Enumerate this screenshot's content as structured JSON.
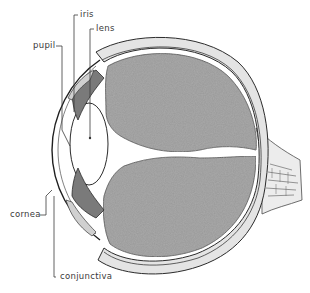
{
  "figure": {
    "title_fragment": "eye",
    "colors": {
      "vitreous_fill": "#9a9a9a",
      "outline": "#2b2b2b",
      "sclera_band": "#e4e4e4",
      "background": "#ffffff",
      "label_text": "#3a3a3a"
    }
  },
  "labels": {
    "pupil": "pupil",
    "iris": "iris",
    "lens": "lens",
    "cornea": "cornea",
    "conjunctiva": "conjunctiva"
  }
}
